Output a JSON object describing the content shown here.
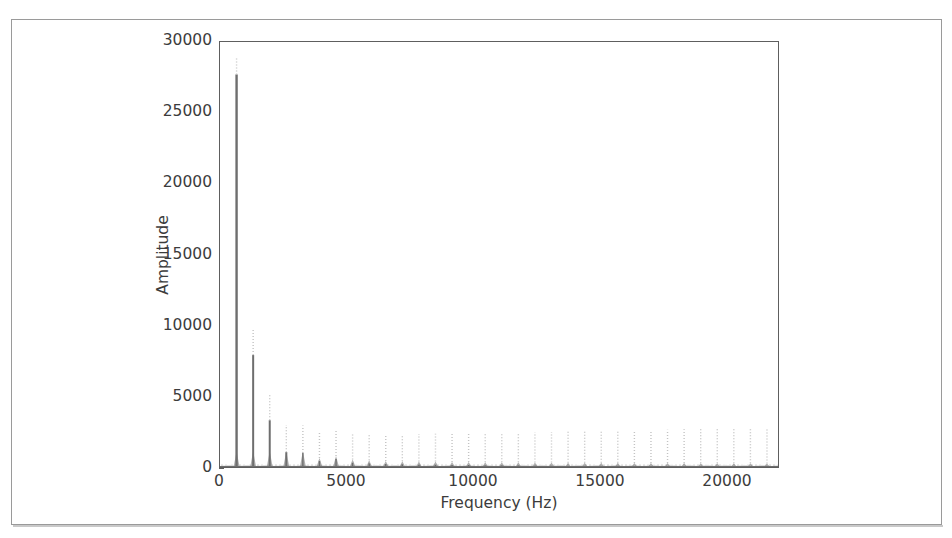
{
  "figure": {
    "background_color": "#ffffff",
    "axes_color": "#5e5e5e",
    "text_color": "#3c3c3c",
    "trace_color": "#6e6e6e",
    "trace_light_color": "#b9b9b9"
  },
  "chart_data": {
    "type": "line",
    "title": "",
    "xlabel": "Frequency (Hz)",
    "ylabel": "Amplitude",
    "xlim": [
      0,
      22050
    ],
    "ylim": [
      0,
      30000
    ],
    "xticks": [
      0,
      5000,
      10000,
      15000,
      20000
    ],
    "xtick_labels": [
      "0",
      "5000",
      "10000",
      "15000",
      "20000"
    ],
    "yticks": [
      0,
      5000,
      10000,
      15000,
      20000,
      25000,
      30000
    ],
    "ytick_labels": [
      "0",
      "5000",
      "10000",
      "15000",
      "20000",
      "25000",
      "30000"
    ],
    "grid": false,
    "legend": null,
    "fundamental_hz": 655,
    "series": [
      {
        "name": "Amplitude spectrum",
        "x": [
          655,
          1310,
          1965,
          2620,
          3275,
          3930,
          4585,
          5240,
          5895,
          6550,
          7205,
          7860,
          8515,
          9170,
          9825,
          10480,
          11135,
          11790,
          12445,
          13100,
          13755,
          14410,
          15065,
          15720,
          16375,
          17030,
          17685,
          18340,
          18995,
          19650,
          20305,
          20960,
          21615
        ],
        "values": [
          27700,
          7900,
          3300,
          1050,
          980,
          430,
          560,
          310,
          260,
          210,
          200,
          180,
          170,
          150,
          140,
          130,
          120,
          115,
          105,
          100,
          95,
          90,
          85,
          80,
          78,
          72,
          68,
          62,
          58,
          54,
          50,
          46,
          40
        ]
      }
    ]
  }
}
